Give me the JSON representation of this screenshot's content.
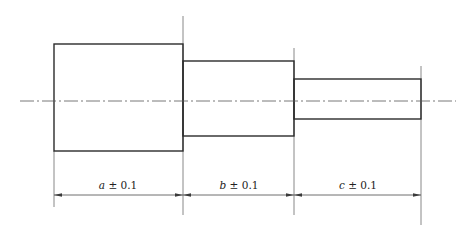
{
  "drawing": {
    "title": "Stepped shaft with toleranced segment lengths",
    "colors": {
      "outline": "#2b2b2b",
      "extension_line": "#6b6b6b",
      "center_line": "#555555",
      "text": "#222222",
      "background": "#ffffff"
    },
    "segments": [
      {
        "name": "a",
        "variable": "a",
        "tolerance": "± 0.1",
        "label": "a ± 0.1",
        "x_start": 54,
        "x_end": 183,
        "y_top": 44,
        "y_bottom": 151
      },
      {
        "name": "b",
        "variable": "b",
        "tolerance": "± 0.1",
        "label": "b ± 0.1",
        "x_start": 183,
        "x_end": 294,
        "y_top": 61,
        "y_bottom": 136
      },
      {
        "name": "c",
        "variable": "c",
        "tolerance": "± 0.1",
        "label": "c ± 0.1",
        "x_start": 294,
        "x_end": 421,
        "y_top": 79,
        "y_bottom": 119
      }
    ],
    "center_line": {
      "y": 101,
      "x_start": 20,
      "x_end": 456
    },
    "dimension_line": {
      "y": 195
    },
    "extension_lines": [
      {
        "x": 54,
        "y_start": 151,
        "y_end": 207
      },
      {
        "x": 183,
        "y_start": 16,
        "y_end": 215
      },
      {
        "x": 294,
        "y_start": 48,
        "y_end": 215
      },
      {
        "x": 421,
        "y_start": 66,
        "y_end": 225
      }
    ]
  }
}
